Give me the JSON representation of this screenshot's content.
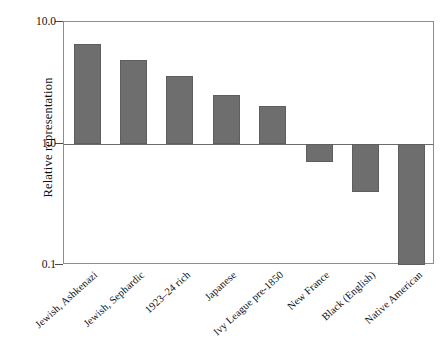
{
  "chart_data": {
    "type": "bar",
    "title": "",
    "xlabel": "",
    "ylabel": "Relative representation",
    "yscale": "log",
    "ylim": [
      0.1,
      10.0
    ],
    "ytick_labels": [
      "10.0",
      "1.0",
      "0.1"
    ],
    "ytick_values": [
      10.0,
      1.0,
      0.1
    ],
    "baseline": 1.0,
    "grid": false,
    "legend": null,
    "bar_color": "#6e6e6e",
    "categories": [
      "Jewish, Ashkenazi",
      "Jewish, Sephardic",
      "1923–24 rich",
      "Japanese",
      "Ivy League pre-1850",
      "New France",
      "Black (English)",
      "Native American"
    ],
    "values": [
      6.6,
      4.9,
      3.6,
      2.5,
      2.05,
      0.71,
      0.4,
      0.1
    ]
  },
  "axis": {
    "y_title": "Relative representation",
    "y_ticks": [
      {
        "label": "10.0",
        "value": 10.0
      },
      {
        "label": "1.0",
        "value": 1.0
      },
      {
        "label": "0.1",
        "value": 0.1
      }
    ]
  },
  "bars": [
    {
      "label": "Jewish, Ashkenazi",
      "value": 6.6
    },
    {
      "label": "Jewish, Sephardic",
      "value": 4.9
    },
    {
      "label": "1923–24 rich",
      "value": 3.6
    },
    {
      "label": "Japanese",
      "value": 2.5
    },
    {
      "label": "Ivy League pre-1850",
      "value": 2.05
    },
    {
      "label": "New France",
      "value": 0.71
    },
    {
      "label": "Black (English)",
      "value": 0.4
    },
    {
      "label": "Native American",
      "value": 0.1
    }
  ]
}
